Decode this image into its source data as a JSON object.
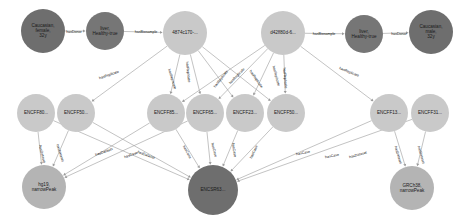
{
  "graph": {
    "title": "ENCODE knowledge graph",
    "colors": {
      "donor_node": "#6e6e6e",
      "biosample_type_node": "#767676",
      "biosample_node": "#c9c9c9",
      "file_node": "#c9c9c9",
      "dataset_node": "#6e6e6e",
      "assembly_node": "#b4b4b4",
      "edge": "#9a9a9a",
      "label_text": "#121212",
      "background": "#ffffff"
    },
    "nodes": [
      {
        "id": "donor_f",
        "label": "Caucasian, female, 32y",
        "lines": [
          "Caucasian,",
          "female,",
          "32y"
        ],
        "x": 43,
        "y": 31,
        "r": 22,
        "kind": "donor"
      },
      {
        "id": "bt_left",
        "label": "liver, Healthy-true",
        "lines": [
          "liver,",
          "Healthy-true"
        ],
        "x": 105,
        "y": 31,
        "r": 19,
        "kind": "biosample_type"
      },
      {
        "id": "bs_left",
        "label": "4874c170-...",
        "lines": [
          "4874c170-..."
        ],
        "x": 185,
        "y": 33,
        "r": 22,
        "kind": "biosample"
      },
      {
        "id": "bs_right",
        "label": "d42ff80d-6...",
        "lines": [
          "d42ff80d-6..."
        ],
        "x": 283,
        "y": 33,
        "r": 22,
        "kind": "biosample"
      },
      {
        "id": "bt_right",
        "label": "liver, Healthy-true",
        "lines": [
          "liver,",
          "Healthy-true"
        ],
        "x": 364,
        "y": 34,
        "r": 19,
        "kind": "biosample_type"
      },
      {
        "id": "donor_m",
        "label": "Caucasian, male, 32y",
        "lines": [
          "Caucasian,",
          "male,",
          "32y"
        ],
        "x": 431,
        "y": 32,
        "r": 22,
        "kind": "donor"
      },
      {
        "id": "f1",
        "label": "ENCFF80...",
        "lines": [
          "ENCFF80..."
        ],
        "x": 36,
        "y": 113,
        "r": 19,
        "kind": "file"
      },
      {
        "id": "f2",
        "label": "ENCFF50...",
        "lines": [
          "ENCFF50..."
        ],
        "x": 76,
        "y": 113,
        "r": 19,
        "kind": "file"
      },
      {
        "id": "f3",
        "label": "ENCFF85...",
        "lines": [
          "ENCFF85..."
        ],
        "x": 166,
        "y": 113,
        "r": 19,
        "kind": "file"
      },
      {
        "id": "f4",
        "label": "ENCFF65...",
        "lines": [
          "ENCFF65..."
        ],
        "x": 205,
        "y": 113,
        "r": 19,
        "kind": "file"
      },
      {
        "id": "f5",
        "label": "ENCFF23...",
        "lines": [
          "ENCFF23..."
        ],
        "x": 245,
        "y": 113,
        "r": 19,
        "kind": "file"
      },
      {
        "id": "f6",
        "label": "ENCFF50...",
        "lines": [
          "ENCFF50..."
        ],
        "x": 286,
        "y": 113,
        "r": 19,
        "kind": "file"
      },
      {
        "id": "f7",
        "label": "ENCFF13...",
        "lines": [
          "ENCFF13..."
        ],
        "x": 389,
        "y": 113,
        "r": 19,
        "kind": "file"
      },
      {
        "id": "f8",
        "label": "ENCFF31...",
        "lines": [
          "ENCFF31..."
        ],
        "x": 430,
        "y": 113,
        "r": 19,
        "kind": "file"
      },
      {
        "id": "asm_hg19",
        "label": "hg19, narrowPeak",
        "lines": [
          "hg19,",
          "narrowPeak"
        ],
        "x": 44,
        "y": 187,
        "r": 22,
        "kind": "assembly"
      },
      {
        "id": "dataset",
        "label": "ENCSR63...",
        "lines": [
          "ENCSR63..."
        ],
        "x": 213,
        "y": 190,
        "r": 25,
        "kind": "dataset"
      },
      {
        "id": "asm_grch38",
        "label": "GRCh38, narrowPeak",
        "lines": [
          "GRCh38,",
          "narrowPeak"
        ],
        "x": 412,
        "y": 188,
        "r": 22,
        "kind": "assembly"
      }
    ],
    "edges": [
      {
        "from": "donor_f",
        "to": "bt_left",
        "label": "hasDonor"
      },
      {
        "from": "bt_left",
        "to": "bs_left",
        "label": "hasBiosample"
      },
      {
        "from": "bs_right",
        "to": "bt_right",
        "label": "hasBiosample"
      },
      {
        "from": "bt_right",
        "to": "donor_m",
        "label": "hasDonor"
      },
      {
        "from": "bs_left",
        "to": "f2",
        "label": "hasReplicate"
      },
      {
        "from": "bs_left",
        "to": "f3",
        "label": "hasReplicate"
      },
      {
        "from": "bs_left",
        "to": "f4",
        "label": "hasReplicate"
      },
      {
        "from": "bs_left",
        "to": "f5",
        "label": "hasReplicate"
      },
      {
        "from": "bs_left",
        "to": "f6",
        "label": "hasReplicate"
      },
      {
        "from": "bs_right",
        "to": "f3",
        "label": "hasReplicate"
      },
      {
        "from": "bs_right",
        "to": "f4",
        "label": "hasReplicate"
      },
      {
        "from": "bs_right",
        "to": "f5",
        "label": "hasReplicate"
      },
      {
        "from": "bs_right",
        "to": "f6",
        "label": "hasReplicate"
      },
      {
        "from": "bs_right",
        "to": "f7",
        "label": "hasReplicate"
      },
      {
        "from": "f1",
        "to": "asm_hg19",
        "label": "hasDataset"
      },
      {
        "from": "f2",
        "to": "asm_hg19",
        "label": "hasDataset"
      },
      {
        "from": "f1",
        "to": "dataset",
        "label": "hasCase"
      },
      {
        "from": "f2",
        "to": "dataset",
        "label": "hasCase"
      },
      {
        "from": "f3",
        "to": "dataset",
        "label": "hasCase"
      },
      {
        "from": "f4",
        "to": "dataset",
        "label": "hasCase"
      },
      {
        "from": "f5",
        "to": "dataset",
        "label": "hasCase"
      },
      {
        "from": "f6",
        "to": "dataset",
        "label": "hasCase"
      },
      {
        "from": "f7",
        "to": "dataset",
        "label": "hasCase"
      },
      {
        "from": "f8",
        "to": "dataset",
        "label": "hasCase"
      },
      {
        "from": "f3",
        "to": "asm_hg19",
        "label": "hasDataset"
      },
      {
        "from": "f4",
        "to": "asm_hg19",
        "label": "hasDataset"
      },
      {
        "from": "f7",
        "to": "asm_grch38",
        "label": "hasDataset"
      },
      {
        "from": "f8",
        "to": "asm_grch38",
        "label": "hasDataset"
      }
    ],
    "edge_labels": [
      {
        "text": "hasDonor",
        "x": 74,
        "y": 32,
        "rot": 0
      },
      {
        "text": "hasBiosample",
        "x": 146,
        "y": 32,
        "rot": 0
      },
      {
        "text": "hasBiosample",
        "x": 324,
        "y": 34,
        "rot": 0
      },
      {
        "text": "hasDonor",
        "x": 399,
        "y": 34,
        "rot": 0
      },
      {
        "text": "hasReplicate",
        "x": 109,
        "y": 75,
        "rot": -19
      },
      {
        "text": "hasReplicate",
        "x": 172,
        "y": 79,
        "rot": 73
      },
      {
        "text": "hasReplicate",
        "x": 188,
        "y": 72,
        "rot": 84
      },
      {
        "text": "hasReplicate",
        "x": 221,
        "y": 79,
        "rot": -52
      },
      {
        "text": "hasReplicate",
        "x": 237,
        "y": 76,
        "rot": -46
      },
      {
        "text": "hasReplicate",
        "x": 256,
        "y": 79,
        "rot": 55
      },
      {
        "text": "hasReplicate",
        "x": 276,
        "y": 76,
        "rot": 75
      },
      {
        "text": "hasReplicate",
        "x": 285,
        "y": 78,
        "rot": 85
      },
      {
        "text": "hasReplicate",
        "x": 349,
        "y": 72,
        "rot": 22
      },
      {
        "text": "hasDataset",
        "x": 42,
        "y": 154,
        "rot": 76
      },
      {
        "text": "hasDataset",
        "x": 60,
        "y": 153,
        "rot": 72
      },
      {
        "text": "hasDataset",
        "x": 104,
        "y": 152,
        "rot": -20
      },
      {
        "text": "hasCase",
        "x": 131,
        "y": 155,
        "rot": -20
      },
      {
        "text": "hasDataset",
        "x": 146,
        "y": 155,
        "rot": 20
      },
      {
        "text": "hasCase",
        "x": 187,
        "y": 152,
        "rot": 62
      },
      {
        "text": "hasCase",
        "x": 214,
        "y": 150,
        "rot": 76
      },
      {
        "text": "hasCase",
        "x": 234,
        "y": 150,
        "rot": 81
      },
      {
        "text": "hasCase",
        "x": 254,
        "y": 152,
        "rot": -65
      },
      {
        "text": "hasCase",
        "x": 303,
        "y": 153,
        "rot": -11
      },
      {
        "text": "hasCase",
        "x": 332,
        "y": 156,
        "rot": -11
      },
      {
        "text": "hasDataset",
        "x": 358,
        "y": 155,
        "rot": -15
      },
      {
        "text": "hasDataset",
        "x": 398,
        "y": 155,
        "rot": 73
      },
      {
        "text": "hasDataset",
        "x": 421,
        "y": 155,
        "rot": 74
      }
    ]
  }
}
